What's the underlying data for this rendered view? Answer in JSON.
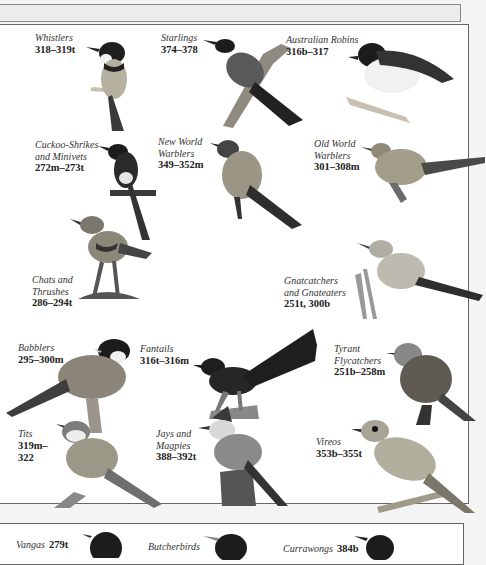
{
  "page": {
    "title_strip": "",
    "groups": [
      {
        "name": "Whistlers",
        "pages": "318–319t"
      },
      {
        "name": "Starlings",
        "pages": "374–378"
      },
      {
        "name": "Australian Robins",
        "pages": "316b–317"
      },
      {
        "name": "Cuckoo-Shrikes and Minivets",
        "name_lines": [
          "Cuckoo-Shrikes",
          "and Minivets"
        ],
        "pages": "272m–273t"
      },
      {
        "name": "New World Warblers",
        "name_lines": [
          "New World",
          "Warblers"
        ],
        "pages": "349–352m"
      },
      {
        "name": "Old World Warblers",
        "name_lines": [
          "Old World",
          "Warblers"
        ],
        "pages": "301–308m"
      },
      {
        "name": "Chats and Thrushes",
        "name_lines": [
          "Chats and",
          "Thrushes"
        ],
        "pages": "286–294t"
      },
      {
        "name": "Gnatcatchers and Gnateaters",
        "name_lines": [
          "Gnatcatchers",
          "and Gnateaters"
        ],
        "pages": "251t, 300b"
      },
      {
        "name": "Babblers",
        "pages": "295–300m"
      },
      {
        "name": "Fantails",
        "pages": "316t–316m"
      },
      {
        "name": "Tyrant Flycatchers",
        "name_lines": [
          "Tyrant",
          "Flycatchers"
        ],
        "pages": "251b–258m"
      },
      {
        "name": "Tits",
        "pages_lines": [
          "319m–",
          "322"
        ],
        "pages": "319m–322"
      },
      {
        "name": "Jays and Magpies",
        "name_lines": [
          "Jays and",
          "Magpies"
        ],
        "pages": "388–392t"
      },
      {
        "name": "Vireos",
        "pages": "353b–355t"
      }
    ],
    "lower_groups": [
      {
        "name": "Vangas",
        "pages": "279t"
      },
      {
        "name": "Butcherbirds",
        "pages": ""
      },
      {
        "name": "Currawongs",
        "pages": "384b"
      }
    ]
  },
  "colors": {
    "ink": "#222222",
    "panel_border": "#666666",
    "strip_bg": "#ececec",
    "bird_dark": "#2a2a2a",
    "bird_mid": "#8a8a8a",
    "bird_light": "#c8c8c8"
  }
}
